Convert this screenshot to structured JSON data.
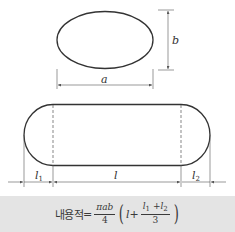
{
  "diagram": {
    "colors": {
      "stroke": "#333333",
      "dimension": "#555555",
      "formula_background": "#e4e4e4"
    },
    "cross_section": {
      "shape": "ellipse",
      "width_label": "a",
      "height_label": "b"
    },
    "side_view": {
      "shape": "stadium",
      "left_head_label": "l",
      "left_head_sub": "1",
      "body_label": "l",
      "right_head_label": "l",
      "right_head_sub": "2"
    }
  },
  "formula": {
    "lhs": "내용적",
    "equals": "=",
    "coef_numerator": "πab",
    "coef_denominator": "4",
    "open_paren": "(",
    "term_l": "l",
    "plus": "+",
    "inner_numerator_l1": "l",
    "inner_numerator_sub1": "1",
    "inner_plus": "+",
    "inner_numerator_l2": "l",
    "inner_numerator_sub2": "2",
    "inner_denominator": "3",
    "close_paren": ")"
  }
}
